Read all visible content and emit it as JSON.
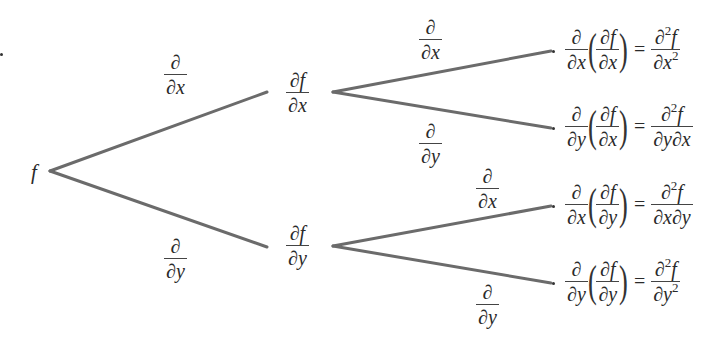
{
  "diagram": {
    "type": "tree-diagram",
    "line_color": "#6b6b6b",
    "root": {
      "label": "f"
    },
    "level1": [
      {
        "edge": {
          "num": "∂",
          "den_op": "∂",
          "den_var": "x"
        },
        "node": {
          "num_op": "∂",
          "num_var": "f",
          "den_op": "∂",
          "den_var": "x"
        }
      },
      {
        "edge": {
          "num": "∂",
          "den_op": "∂",
          "den_var": "y"
        },
        "node": {
          "num_op": "∂",
          "num_var": "f",
          "den_op": "∂",
          "den_var": "y"
        }
      }
    ],
    "level2": [
      {
        "edge": {
          "num": "∂",
          "den_op": "∂",
          "den_var": "x"
        },
        "result": {
          "outer_den_var": "x",
          "inner_den_var": "x",
          "equals": "=",
          "rhs_num": "∂",
          "rhs_sup": "2",
          "rhs_var": "f",
          "rhs_den": [
            {
              "op": "∂",
              "var": "x",
              "sup": "2"
            }
          ]
        }
      },
      {
        "edge": {
          "num": "∂",
          "den_op": "∂",
          "den_var": "y"
        },
        "result": {
          "outer_den_var": "y",
          "inner_den_var": "x",
          "equals": "=",
          "rhs_num": "∂",
          "rhs_sup": "2",
          "rhs_var": "f",
          "rhs_den": [
            {
              "op": "∂",
              "var": "y"
            },
            {
              "op": "∂",
              "var": "x"
            }
          ]
        }
      },
      {
        "edge": {
          "num": "∂",
          "den_op": "∂",
          "den_var": "x"
        },
        "result": {
          "outer_den_var": "x",
          "inner_den_var": "y",
          "equals": "=",
          "rhs_num": "∂",
          "rhs_sup": "2",
          "rhs_var": "f",
          "rhs_den": [
            {
              "op": "∂",
              "var": "x"
            },
            {
              "op": "∂",
              "var": "y"
            }
          ]
        }
      },
      {
        "edge": {
          "num": "∂",
          "den_op": "∂",
          "den_var": "y"
        },
        "result": {
          "outer_den_var": "y",
          "inner_den_var": "y",
          "equals": "=",
          "rhs_num": "∂",
          "rhs_sup": "2",
          "rhs_var": "f",
          "rhs_den": [
            {
              "op": "∂",
              "var": "y",
              "sup": "2"
            }
          ]
        }
      }
    ]
  }
}
